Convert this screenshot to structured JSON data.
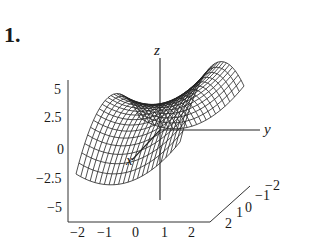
{
  "problem_number": "1.",
  "chart_data": {
    "type": "surface3d",
    "title": "",
    "function_shape": "saddle / parabolic trough (z decreases with x^2, increases with y^2)",
    "axes": {
      "x": {
        "label": "x",
        "ticks": [
          "-2",
          "-1",
          "0",
          "1",
          "2"
        ]
      },
      "y": {
        "label": "y",
        "ticks": [
          "2",
          "1",
          "0",
          "-1",
          "-2"
        ]
      },
      "z": {
        "label": "z",
        "ticks": [
          "5",
          "2.5",
          "0",
          "-2.5",
          "-5"
        ]
      }
    },
    "xlim": [
      -2,
      2
    ],
    "ylim": [
      -2,
      2
    ],
    "zlim": [
      -5,
      5
    ],
    "grid": false,
    "style": "wireframe mesh"
  },
  "labels": {
    "z_ticks": [
      "5",
      "2.5",
      "0",
      "−2.5",
      "−5"
    ],
    "x_ticks": [
      "−2",
      "−1",
      "0",
      "1",
      "2"
    ],
    "y_ticks": [
      "2",
      "1",
      "0",
      "−1",
      "−2"
    ],
    "x_axis": "x",
    "y_axis": "y",
    "z_axis": "z"
  }
}
